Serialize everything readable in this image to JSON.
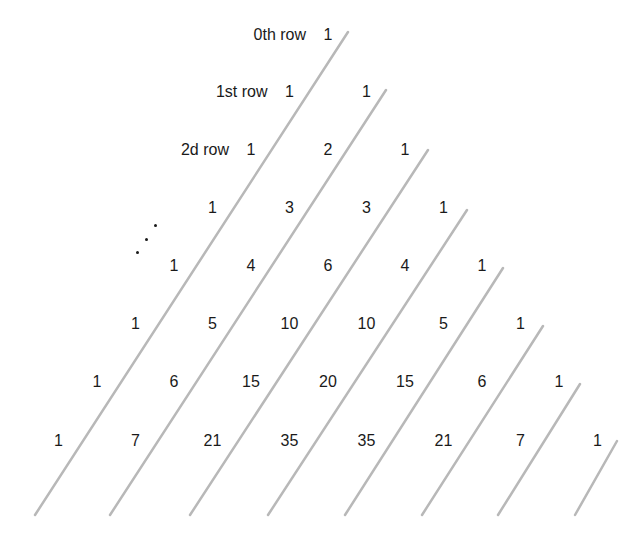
{
  "row_labels": [
    {
      "row": 0,
      "text": "0th row"
    },
    {
      "row": 1,
      "text": "1st row"
    },
    {
      "row": 2,
      "text": "2d row"
    }
  ],
  "ellipsis": "⋰",
  "rows": [
    [
      1
    ],
    [
      1,
      1
    ],
    [
      1,
      2,
      1
    ],
    [
      1,
      3,
      3,
      1
    ],
    [
      1,
      4,
      6,
      4,
      1
    ],
    [
      1,
      5,
      10,
      10,
      5,
      1
    ],
    [
      1,
      6,
      15,
      20,
      15,
      6,
      1
    ],
    [
      1,
      7,
      21,
      35,
      35,
      21,
      7,
      1
    ]
  ],
  "diagonal_lines": [
    {
      "x1": 348,
      "y1": 32,
      "x2": 35,
      "y2": 515
    },
    {
      "x1": 386,
      "y1": 90,
      "x2": 110,
      "y2": 515
    },
    {
      "x1": 428,
      "y1": 150,
      "x2": 190,
      "y2": 515
    },
    {
      "x1": 467,
      "y1": 210,
      "x2": 268,
      "y2": 515
    },
    {
      "x1": 503,
      "y1": 268,
      "x2": 345,
      "y2": 515
    },
    {
      "x1": 543,
      "y1": 326,
      "x2": 422,
      "y2": 515
    },
    {
      "x1": 580,
      "y1": 384,
      "x2": 498,
      "y2": 515
    },
    {
      "x1": 617,
      "y1": 441,
      "x2": 575,
      "y2": 515
    }
  ],
  "colors": {
    "text": "#1a1a1a",
    "line": "#b8b8b8",
    "background": "#ffffff"
  }
}
